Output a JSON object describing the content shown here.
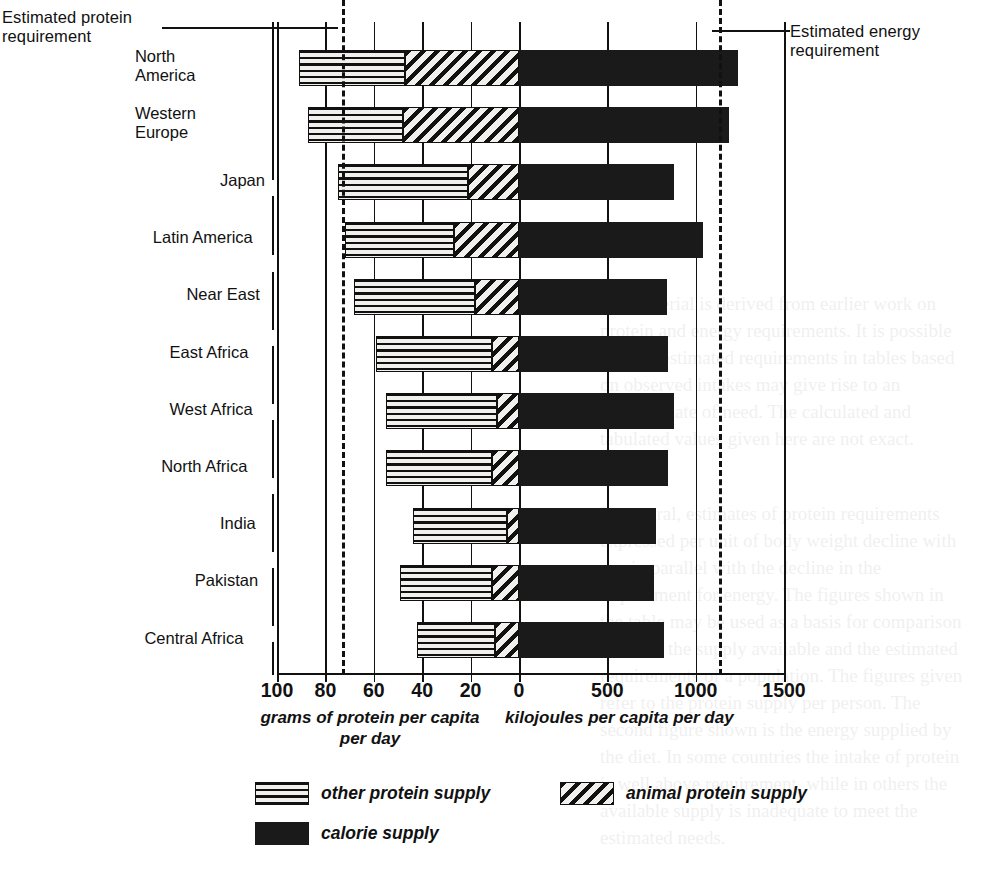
{
  "annotations": {
    "protein_requirement": "Estimated protein\nrequirement",
    "energy_requirement": "Estimated energy\nrequirement"
  },
  "axes": {
    "left_title": "grams of protein per capita\nper day",
    "right_title": "kilojoules per capita per day",
    "protein_ticks": [
      "100",
      "80",
      "60",
      "40",
      "20",
      "0"
    ],
    "energy_ticks": [
      "500",
      "1000",
      "1500"
    ]
  },
  "legend": {
    "other_protein": "other protein supply",
    "animal_protein": "animal protein supply",
    "calorie": "calorie supply"
  },
  "chart_data": {
    "type": "bar",
    "orientation": "horizontal-diverging",
    "title": "",
    "xlabel_left": "grams of protein per capita per day",
    "xlabel_right": "kilojoules per capita per day",
    "ylabel": "",
    "grid": true,
    "legend_position": "bottom-left",
    "left_axis": {
      "label": "grams of protein per capita per day",
      "ticks": [
        100,
        80,
        60,
        40,
        20,
        0
      ],
      "range": [
        100,
        0
      ],
      "direction": "right-to-left"
    },
    "right_axis": {
      "label": "kilojoules per capita per day",
      "ticks": [
        0,
        500,
        1000,
        1500
      ],
      "range": [
        0,
        1500
      ],
      "direction": "left-to-right"
    },
    "reference_lines": [
      {
        "name": "Estimated protein requirement",
        "axis": "left",
        "value": 73,
        "style": "dashed"
      },
      {
        "name": "Estimated energy requirement",
        "axis": "right",
        "value": 1130,
        "style": "dashed"
      }
    ],
    "categories": [
      "North\nAmerica",
      "Western\nEurope",
      "Japan",
      "Latin America",
      "Near East",
      "East Africa",
      "West Africa",
      "North Africa",
      "India",
      "Pakistan",
      "Central Africa"
    ],
    "series": [
      {
        "name": "other protein supply",
        "units": "grams per capita per day",
        "values": [
          44,
          39,
          54,
          45,
          50,
          48,
          46,
          44,
          39,
          38,
          32
        ]
      },
      {
        "name": "animal protein supply",
        "units": "grams per capita per day",
        "values": [
          47,
          48,
          21,
          27,
          18,
          11,
          9,
          11,
          5,
          11,
          10
        ]
      },
      {
        "name": "calorie supply",
        "units": "kilojoules per capita per day",
        "values": [
          1240,
          1190,
          875,
          1040,
          840,
          845,
          875,
          845,
          775,
          765,
          820
        ]
      }
    ]
  },
  "rows": [
    {
      "label": "North\nAmerica",
      "other": 44,
      "animal": 47,
      "calorie": 1240
    },
    {
      "label": "Western\nEurope",
      "other": 39,
      "animal": 48,
      "calorie": 1190
    },
    {
      "label": "Japan",
      "other": 54,
      "animal": 21,
      "calorie": 875
    },
    {
      "label": "Latin America",
      "other": 45,
      "animal": 27,
      "calorie": 1040
    },
    {
      "label": "Near East",
      "other": 50,
      "animal": 18,
      "calorie": 840
    },
    {
      "label": "East Africa",
      "other": 48,
      "animal": 11,
      "calorie": 845
    },
    {
      "label": "West Africa",
      "other": 46,
      "animal": 9,
      "calorie": 875
    },
    {
      "label": "North Africa",
      "other": 44,
      "animal": 11,
      "calorie": 845
    },
    {
      "label": "India",
      "other": 39,
      "animal": 5,
      "calorie": 775
    },
    {
      "label": "Pakistan",
      "other": 38,
      "animal": 11,
      "calorie": 765
    },
    {
      "label": "Central Africa",
      "other": 32,
      "animal": 10,
      "calorie": 820
    }
  ],
  "ghost_text": {
    "col1": "this material is derived from earlier work on protein\nand energy requirements.\nIt is possible that the estimated requirements in\ntables based on observed intakes may give rise to an\noverestimate of need.\nThe calculated and tabulated values given here are\nnot exact.",
    "col2": "In general, estimates of protein requirements\nexpressed per unit of body weight decline with age\nin parallel with the decline in the requirement for\nenergy.\nThe figures shown in the table may be used as a\nbasis for comparison between the supply available\nand the estimated requirements of a population.\nThe figures given refer to the protein supply per\nperson. The second figure shown is the energy supplied by\nthe diet. In some countries the intake of protein is\nwell above requirement, while in others the available\nsupply is inadequate to meet the estimated needs."
  }
}
